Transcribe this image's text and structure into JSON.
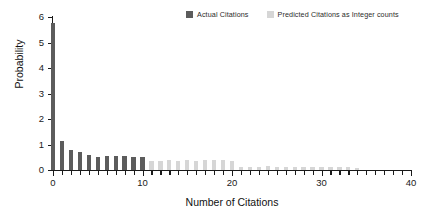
{
  "chart_data": {
    "type": "bar",
    "title": "",
    "xlabel": "Number of Citations",
    "ylabel": "Probability",
    "xlim": [
      0,
      40
    ],
    "ylim": [
      0,
      6
    ],
    "xticks": [
      0,
      10,
      20,
      30,
      40
    ],
    "yticks": [
      0,
      1,
      2,
      3,
      4,
      5,
      6
    ],
    "xtick_labels": [
      "0",
      "10",
      "20",
      "30",
      "40"
    ],
    "ytick_labels": [
      "0",
      "1",
      "2",
      "3",
      "4",
      "5",
      "6"
    ],
    "grid": false,
    "legend_position": "top-right",
    "series": [
      {
        "name": "Actual Citations",
        "color": "#5c5c5c",
        "x": [
          0,
          1,
          2,
          3,
          4,
          5,
          6,
          7,
          8,
          9,
          10
        ],
        "values": [
          5.75,
          1.15,
          0.8,
          0.72,
          0.6,
          0.52,
          0.55,
          0.55,
          0.55,
          0.53,
          0.53
        ]
      },
      {
        "name": "Predicted Citations as Integer counts",
        "color": "#d6d6d6",
        "x": [
          11,
          12,
          13,
          14,
          15,
          16,
          17,
          18,
          19,
          20,
          21,
          22,
          23,
          24,
          25,
          26,
          27,
          28,
          29,
          30,
          31,
          32,
          33,
          34
        ],
        "values": [
          0.37,
          0.36,
          0.4,
          0.36,
          0.4,
          0.37,
          0.38,
          0.4,
          0.4,
          0.37,
          0.13,
          0.13,
          0.13,
          0.14,
          0.11,
          0.12,
          0.12,
          0.11,
          0.12,
          0.12,
          0.12,
          0.1,
          0.1,
          0.09
        ]
      }
    ]
  },
  "legend": {
    "entries": [
      {
        "label": "Actual Citations",
        "color": "#5c5c5c"
      },
      {
        "label": "Predicted Citations as Integer counts",
        "color": "#d6d6d6"
      }
    ]
  },
  "axes": {
    "x_title": "Number of Citations",
    "y_title": "Probability"
  }
}
